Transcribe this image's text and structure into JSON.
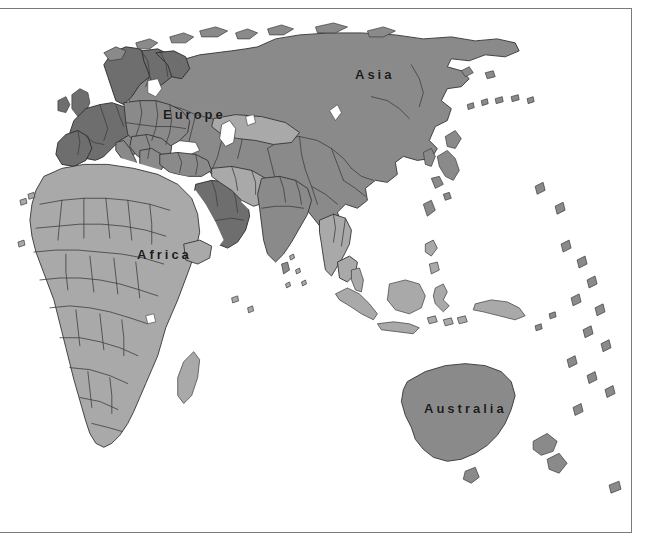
{
  "canvas": {
    "width": 652,
    "height": 550,
    "background": "#ffffff"
  },
  "frame": {
    "name": "map-frame",
    "x": 0,
    "y": 8,
    "width": 632,
    "height": 525,
    "border_color": "#7a7a7a",
    "border_width": 1,
    "fill": "#ffffff"
  },
  "map": {
    "title": "World map (Eastern Hemisphere)",
    "ocean_color": "#ffffff",
    "land_color": "#8a8a8a",
    "land_light_color": "#a9a9a9",
    "land_highlight_color": "#6e6e6e",
    "border_stroke": "#2b2b2b",
    "coast_stroke": "#3a3a3a",
    "projection_note": "Eastern Hemisphere: Europe, Africa, Asia, Australia",
    "labels": [
      {
        "text": "Asia",
        "x": 355,
        "y": 66,
        "name": "map-label-asia"
      },
      {
        "text": "Europe",
        "x": 163,
        "y": 106,
        "name": "map-label-europe"
      },
      {
        "text": "Africa",
        "x": 137,
        "y": 246,
        "name": "map-label-africa"
      },
      {
        "text": "Australia",
        "x": 424,
        "y": 400,
        "name": "map-label-australia"
      }
    ],
    "regions": [
      {
        "name": "asia",
        "label": "Asia",
        "shade": "#8a8a8a",
        "highlighted": false
      },
      {
        "name": "europe",
        "label": "Europe",
        "shade": "#8a8a8a",
        "highlighted": false
      },
      {
        "name": "africa",
        "label": "Africa",
        "shade": "#a9a9a9",
        "highlighted": false
      },
      {
        "name": "australia",
        "label": "Australia",
        "shade": "#8a8a8a",
        "highlighted": false
      },
      {
        "name": "scandinavia",
        "label": "Norway / Sweden / Finland",
        "shade": "#6e6e6e",
        "highlighted": true
      },
      {
        "name": "western-europe",
        "label": "UK / France / Spain / Germany",
        "shade": "#6e6e6e",
        "highlighted": true
      },
      {
        "name": "arabian-peninsula",
        "label": "Saudi Arabia",
        "shade": "#6e6e6e",
        "highlighted": true
      },
      {
        "name": "kazakhstan",
        "label": "Kazakhstan",
        "shade": "#a9a9a9",
        "highlighted": false
      },
      {
        "name": "north-africa",
        "label": "North Africa",
        "shade": "#a9a9a9",
        "highlighted": false
      },
      {
        "name": "india",
        "label": "India",
        "shade": "#8a8a8a",
        "highlighted": false
      },
      {
        "name": "southeast-asia",
        "label": "Southeast Asia",
        "shade": "#a9a9a9",
        "highlighted": false
      },
      {
        "name": "new-zealand",
        "label": "New Zealand",
        "shade": "#8a8a8a",
        "highlighted": false
      },
      {
        "name": "japan",
        "label": "Japan",
        "shade": "#8a8a8a",
        "highlighted": false
      },
      {
        "name": "madagascar",
        "label": "Madagascar",
        "shade": "#a9a9a9",
        "highlighted": false
      }
    ]
  }
}
